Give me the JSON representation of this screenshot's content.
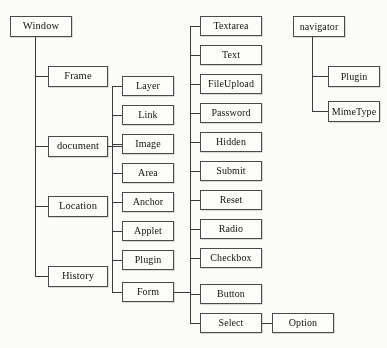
{
  "diagram": {
    "style": {
      "box_border_color": "#4a4a4a",
      "line_color": "#3a3a3a",
      "background": "#fbfbf9",
      "text_color": "#141414"
    },
    "nodes": [
      {
        "id": "window",
        "label": "Window",
        "x": 10,
        "y": 16,
        "w": 62,
        "h": 21,
        "font_size": 10.5
      },
      {
        "id": "frame",
        "label": "Frame",
        "x": 48,
        "y": 66,
        "w": 60,
        "h": 21,
        "font_size": 10.5
      },
      {
        "id": "document",
        "label": "document",
        "x": 48,
        "y": 136,
        "w": 60,
        "h": 21,
        "font_size": 10.5
      },
      {
        "id": "location",
        "label": "Location",
        "x": 48,
        "y": 196,
        "w": 60,
        "h": 21,
        "font_size": 10.5
      },
      {
        "id": "history",
        "label": "History",
        "x": 48,
        "y": 266,
        "w": 60,
        "h": 21,
        "font_size": 10.5
      },
      {
        "id": "layer",
        "label": "Layer",
        "x": 122,
        "y": 76,
        "w": 52,
        "h": 20,
        "font_size": 10
      },
      {
        "id": "link",
        "label": "Link",
        "x": 122,
        "y": 105,
        "w": 52,
        "h": 20,
        "font_size": 10
      },
      {
        "id": "image",
        "label": "Image",
        "x": 122,
        "y": 134,
        "w": 52,
        "h": 20,
        "font_size": 10
      },
      {
        "id": "area",
        "label": "Area",
        "x": 122,
        "y": 163,
        "w": 52,
        "h": 20,
        "font_size": 10
      },
      {
        "id": "anchor",
        "label": "Anchor",
        "x": 122,
        "y": 192,
        "w": 52,
        "h": 20,
        "font_size": 10
      },
      {
        "id": "applet",
        "label": "Applet",
        "x": 122,
        "y": 221,
        "w": 52,
        "h": 20,
        "font_size": 10
      },
      {
        "id": "plugin-doc",
        "label": "Plugin",
        "x": 122,
        "y": 250,
        "w": 52,
        "h": 20,
        "font_size": 10
      },
      {
        "id": "form",
        "label": "Form",
        "x": 122,
        "y": 282,
        "w": 52,
        "h": 20,
        "font_size": 10
      },
      {
        "id": "textarea",
        "label": "Textarea",
        "x": 200,
        "y": 16,
        "w": 62,
        "h": 20,
        "font_size": 10
      },
      {
        "id": "text",
        "label": "Text",
        "x": 200,
        "y": 45,
        "w": 62,
        "h": 20,
        "font_size": 10
      },
      {
        "id": "fileupload",
        "label": "FileUpload",
        "x": 200,
        "y": 74,
        "w": 62,
        "h": 20,
        "font_size": 10
      },
      {
        "id": "password",
        "label": "Password",
        "x": 200,
        "y": 103,
        "w": 62,
        "h": 20,
        "font_size": 10
      },
      {
        "id": "hidden",
        "label": "Hidden",
        "x": 200,
        "y": 132,
        "w": 62,
        "h": 20,
        "font_size": 10
      },
      {
        "id": "submit",
        "label": "Submit",
        "x": 200,
        "y": 161,
        "w": 62,
        "h": 20,
        "font_size": 10
      },
      {
        "id": "reset",
        "label": "Reset",
        "x": 200,
        "y": 190,
        "w": 62,
        "h": 20,
        "font_size": 10
      },
      {
        "id": "radio",
        "label": "Radio",
        "x": 200,
        "y": 219,
        "w": 62,
        "h": 20,
        "font_size": 10
      },
      {
        "id": "checkbox",
        "label": "Checkbox",
        "x": 200,
        "y": 248,
        "w": 62,
        "h": 20,
        "font_size": 10
      },
      {
        "id": "button",
        "label": "Button",
        "x": 200,
        "y": 284,
        "w": 62,
        "h": 20,
        "font_size": 10
      },
      {
        "id": "select",
        "label": "Select",
        "x": 200,
        "y": 313,
        "w": 62,
        "h": 20,
        "font_size": 10
      },
      {
        "id": "option",
        "label": "Option",
        "x": 272,
        "y": 313,
        "w": 62,
        "h": 20,
        "font_size": 10
      },
      {
        "id": "navigator",
        "label": "navigator",
        "x": 293,
        "y": 16,
        "w": 52,
        "h": 21,
        "font_size": 10
      },
      {
        "id": "plugin-nav",
        "label": "Plugin",
        "x": 328,
        "y": 66,
        "w": 52,
        "h": 21,
        "font_size": 10
      },
      {
        "id": "mimetype",
        "label": "MimeType",
        "x": 328,
        "y": 101,
        "w": 52,
        "h": 21,
        "font_size": 10
      }
    ],
    "edges": [
      {
        "id": "window-stem",
        "orient": "v",
        "x": 35,
        "y": 37,
        "len": 240
      },
      {
        "id": "window-to-frame",
        "orient": "h",
        "x": 35,
        "y": 76,
        "len": 13
      },
      {
        "id": "window-to-document",
        "orient": "h",
        "x": 35,
        "y": 146,
        "len": 13
      },
      {
        "id": "window-to-location",
        "orient": "h",
        "x": 35,
        "y": 206,
        "len": 13
      },
      {
        "id": "window-to-history",
        "orient": "h",
        "x": 35,
        "y": 276,
        "len": 13
      },
      {
        "id": "document-out",
        "orient": "h",
        "x": 108,
        "y": 146,
        "len": 14
      },
      {
        "id": "document-stem",
        "orient": "v",
        "x": 112,
        "y": 86,
        "len": 206
      },
      {
        "id": "document-to-layer",
        "orient": "h",
        "x": 112,
        "y": 86,
        "len": 10
      },
      {
        "id": "document-to-link",
        "orient": "h",
        "x": 112,
        "y": 115,
        "len": 10
      },
      {
        "id": "document-to-image",
        "orient": "h",
        "x": 112,
        "y": 144,
        "len": 10
      },
      {
        "id": "document-to-area",
        "orient": "h",
        "x": 112,
        "y": 173,
        "len": 10
      },
      {
        "id": "document-to-anchor",
        "orient": "h",
        "x": 112,
        "y": 202,
        "len": 10
      },
      {
        "id": "document-to-applet",
        "orient": "h",
        "x": 112,
        "y": 231,
        "len": 10
      },
      {
        "id": "document-to-plugin",
        "orient": "h",
        "x": 112,
        "y": 260,
        "len": 10
      },
      {
        "id": "document-to-form",
        "orient": "h",
        "x": 112,
        "y": 292,
        "len": 10
      },
      {
        "id": "form-out",
        "orient": "h",
        "x": 174,
        "y": 292,
        "len": 16
      },
      {
        "id": "form-stem",
        "orient": "v",
        "x": 190,
        "y": 26,
        "len": 297
      },
      {
        "id": "form-to-textarea",
        "orient": "h",
        "x": 190,
        "y": 26,
        "len": 10
      },
      {
        "id": "form-to-text",
        "orient": "h",
        "x": 190,
        "y": 55,
        "len": 10
      },
      {
        "id": "form-to-fileupload",
        "orient": "h",
        "x": 190,
        "y": 84,
        "len": 10
      },
      {
        "id": "form-to-password",
        "orient": "h",
        "x": 190,
        "y": 113,
        "len": 10
      },
      {
        "id": "form-to-hidden",
        "orient": "h",
        "x": 190,
        "y": 142,
        "len": 10
      },
      {
        "id": "form-to-submit",
        "orient": "h",
        "x": 190,
        "y": 171,
        "len": 10
      },
      {
        "id": "form-to-reset",
        "orient": "h",
        "x": 190,
        "y": 200,
        "len": 10
      },
      {
        "id": "form-to-radio",
        "orient": "h",
        "x": 190,
        "y": 229,
        "len": 10
      },
      {
        "id": "form-to-checkbox",
        "orient": "h",
        "x": 190,
        "y": 258,
        "len": 10
      },
      {
        "id": "form-to-button",
        "orient": "h",
        "x": 190,
        "y": 294,
        "len": 10
      },
      {
        "id": "form-to-select",
        "orient": "h",
        "x": 190,
        "y": 323,
        "len": 10
      },
      {
        "id": "select-to-option",
        "orient": "h",
        "x": 262,
        "y": 323,
        "len": 10
      },
      {
        "id": "navigator-stem",
        "orient": "v",
        "x": 312,
        "y": 37,
        "len": 75
      },
      {
        "id": "navigator-to-plugin",
        "orient": "h",
        "x": 312,
        "y": 76,
        "len": 16
      },
      {
        "id": "navigator-to-mime",
        "orient": "h",
        "x": 312,
        "y": 111,
        "len": 16
      }
    ]
  }
}
